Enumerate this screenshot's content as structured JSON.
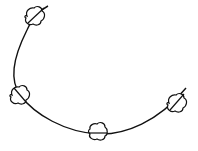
{
  "diagram": {
    "type": "curve-with-nodes",
    "stroke_color": "#111111",
    "background": "#ffffff",
    "curve": "arc from upper-left sweeping down and right to lower-right",
    "nodes": [
      {
        "id": "node-1",
        "shape": "cloud",
        "position": "top"
      },
      {
        "id": "node-2",
        "shape": "cloud",
        "position": "left"
      },
      {
        "id": "node-3",
        "shape": "cloud",
        "position": "bottom"
      },
      {
        "id": "node-4",
        "shape": "cloud",
        "position": "right"
      }
    ],
    "caption": ""
  }
}
